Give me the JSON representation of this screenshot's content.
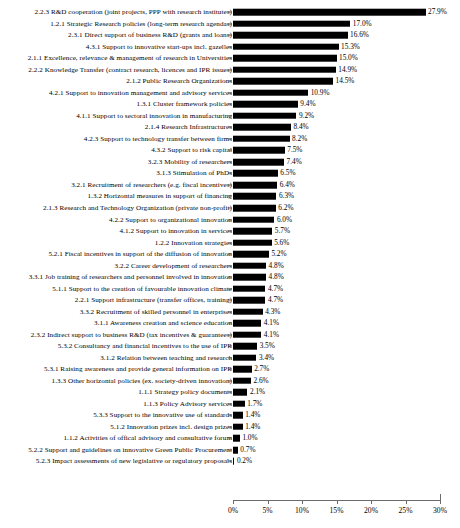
{
  "chart_data": {
    "type": "bar",
    "orientation": "horizontal",
    "title": "",
    "subtitle": "",
    "xlabel": "",
    "ylabel": "",
    "xlim": [
      0,
      30
    ],
    "grid": false,
    "legend": false,
    "value_suffix": "%",
    "xticks": [
      "0%",
      "5%",
      "10%",
      "15%",
      "20%",
      "25%",
      "30%"
    ],
    "xtick_values": [
      0,
      5,
      10,
      15,
      20,
      25,
      30
    ],
    "categories": [
      "2.2.3 R&D cooperation (joint projects, PPP with research institutes)",
      "1.2.1 Strategic Research policies (long-term research agendas)",
      "2.3.1 Direct support of business R&D (grants and loans)",
      "4.3.1 Support to innovative start-ups incl. gazelles",
      "2.1.1 Excellence, relevance & management of research in Universities",
      "2.2.2 Knowledge Transfer (contract research, licences and IPR issues)",
      "2.1.2 Public Research Organizations",
      "4.2.1 Support to innovation management and advisory services",
      "1.3.1 Cluster framework policies",
      "4.1.1 Support to sectoral innovation in manufacturing",
      "2.1.4 Research Infrastructures",
      "4.2.3 Support to technology transfer between firms",
      "4.3.2 Support to risk capital",
      "3.2.3 Mobility of researchers",
      "3.1.3 Stimulation of PhDs",
      "3.2.1 Recruitment of researchers (e.g. fiscal incentives)",
      "1.3.2 Horizontal measures in support of financing",
      "2.1.3 Research and Technology Organization (private non-profit)",
      "4.2.2 Support to organizational innovation",
      "4.1.2 Support to innovation in services",
      "1.2.2 Innovation strategies",
      "5.2.1 Fiscal incentives in support of the diffusion of innovation",
      "3.2.2 Career development of researchers",
      "3.3.1 Job training of researchers and personnel involved in innovation",
      "5.1.1 Support to the creation of favourable innovation climate",
      "2.2.1 Support infrastructure (transfer offices, training)",
      "3.3.2 Recruitment of skilled personnel in enterprises",
      "3.1.1 Awareness creation and science education",
      "2.3.2 Indirect support to business R&D (tax incentives & guarantees)",
      "5.3.2 Consultancy and financial incentives to the use of IPR",
      "3.1.2 Relation between teaching and research",
      "5.3.1 Raising awareness and provide general information on IPR",
      "1.3.3 Other horizontal policies (ex. society-driven innovation)",
      "1.1.1 Strategy policy documents",
      "1.1.3 Policy Advisory services",
      "5.3.3 Support to the innovative use of standards",
      "5.1.2 Innovation prizes incl. design prizes",
      "1.1.2 Activities of offical advisory and consultative forum",
      "5.2.2 Support and guidelines on innovative Green Public Procurement",
      "5.2.3 Impact assessments of new legislative or regulatory proposals"
    ],
    "values": [
      27.9,
      17.0,
      16.6,
      15.3,
      15.0,
      14.9,
      14.5,
      10.9,
      9.4,
      9.2,
      8.4,
      8.2,
      7.5,
      7.4,
      6.5,
      6.4,
      6.3,
      6.2,
      6.0,
      5.7,
      5.6,
      5.2,
      4.8,
      4.8,
      4.7,
      4.7,
      4.3,
      4.1,
      4.1,
      3.5,
      3.4,
      2.7,
      2.6,
      2.1,
      1.7,
      1.4,
      1.4,
      1.0,
      0.7,
      0.2
    ],
    "value_labels": [
      "27.9%",
      "17.0%",
      "16.6%",
      "15.3%",
      "15.0%",
      "14.9%",
      "14.5%",
      "10.9%",
      "9.4%",
      "9.2%",
      "8.4%",
      "8.2%",
      "7.5%",
      "7.4%",
      "6.5%",
      "6.4%",
      "6.3%",
      "6.2%",
      "6.0%",
      "5.7%",
      "5.6%",
      "5.2%",
      "4.8%",
      "4.8%",
      "4.7%",
      "4.7%",
      "4.3%",
      "4.1%",
      "4.1%",
      "3.5%",
      "3.4%",
      "2.7%",
      "2.6%",
      "2.1%",
      "1.7%",
      "1.4%",
      "1.4%",
      "1.0%",
      "0.7%",
      "0.2%"
    ],
    "bar_color": "#000000",
    "axis_color": "#6b6b6b",
    "text_color": "#000000"
  }
}
